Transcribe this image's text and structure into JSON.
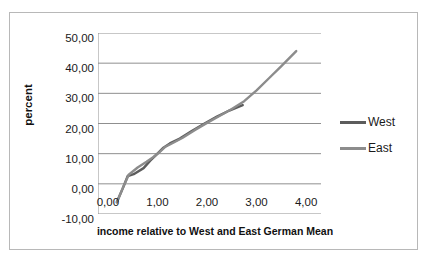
{
  "chart_data": {
    "type": "line",
    "title": "",
    "xlabel": "income relative to West and East German Mean",
    "ylabel": "percent",
    "xlim": [
      -0.2,
      4.3
    ],
    "ylim": [
      -10,
      50
    ],
    "grid": true,
    "legend_position": "right",
    "x_ticks": [
      "0,00",
      "1,00",
      "2,00",
      "3,00",
      "4,00"
    ],
    "x_tick_values": [
      0,
      1,
      2,
      3,
      4
    ],
    "y_ticks": [
      "50,00",
      "40,00",
      "30,00",
      "20,00",
      "10,00",
      "0,00",
      "-10,00"
    ],
    "y_tick_values": [
      50,
      40,
      30,
      20,
      10,
      0,
      -10
    ],
    "series": [
      {
        "name": "West",
        "color": "#5c5c5c",
        "points": [
          [
            0.18,
            -6.0
          ],
          [
            0.3,
            -1.5
          ],
          [
            0.4,
            2.6
          ],
          [
            0.52,
            3.2
          ],
          [
            0.72,
            5.2
          ],
          [
            0.85,
            7.6
          ],
          [
            1.0,
            10.0
          ],
          [
            1.12,
            12.0
          ],
          [
            1.25,
            13.4
          ],
          [
            1.45,
            15.0
          ],
          [
            1.7,
            17.6
          ],
          [
            1.95,
            20.0
          ],
          [
            2.2,
            22.3
          ],
          [
            2.45,
            24.3
          ],
          [
            2.72,
            26.1
          ]
        ]
      },
      {
        "name": "East",
        "color": "#8c8c8c",
        "points": [
          [
            0.18,
            -6.2
          ],
          [
            0.32,
            -0.6
          ],
          [
            0.42,
            3.0
          ],
          [
            0.6,
            5.4
          ],
          [
            0.78,
            7.3
          ],
          [
            0.92,
            8.9
          ],
          [
            1.02,
            10.2
          ],
          [
            1.15,
            12.2
          ],
          [
            1.28,
            13.3
          ],
          [
            1.5,
            15.2
          ],
          [
            1.75,
            17.8
          ],
          [
            2.0,
            20.2
          ],
          [
            2.25,
            22.5
          ],
          [
            2.5,
            24.8
          ],
          [
            2.75,
            27.4
          ],
          [
            3.0,
            31.0
          ],
          [
            3.25,
            35.0
          ],
          [
            3.5,
            39.0
          ],
          [
            3.8,
            44.0
          ]
        ]
      }
    ],
    "legend": [
      {
        "label": "West",
        "color": "#5c5c5c"
      },
      {
        "label": "East",
        "color": "#8c8c8c"
      }
    ]
  }
}
